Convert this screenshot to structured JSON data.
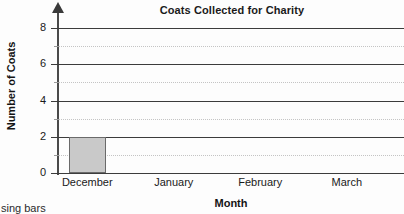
{
  "chart_data": {
    "type": "bar",
    "title": "Coats Collected for Charity",
    "xlabel": "Month",
    "ylabel": "Number of Coats",
    "categories": [
      "December",
      "January",
      "February",
      "March"
    ],
    "values": [
      2,
      0,
      0,
      0
    ],
    "ylim": [
      0,
      8
    ],
    "ytick_labels": [
      "0",
      "2",
      "4",
      "6",
      "8"
    ],
    "ytick_values": [
      0,
      2,
      4,
      6,
      8
    ],
    "minor_gridline_values": [
      1,
      3,
      5,
      7
    ],
    "grid": true,
    "legend": false,
    "bar_fill_color": "#c9c9c9",
    "bar_border_color": "#6a6a6a",
    "major_gridline_color": "#3c3c3c",
    "minor_gridline_color": "#c4c4c4",
    "axis_color": "#4a4a4a"
  },
  "page": {
    "stray_caption": "sing bars"
  }
}
